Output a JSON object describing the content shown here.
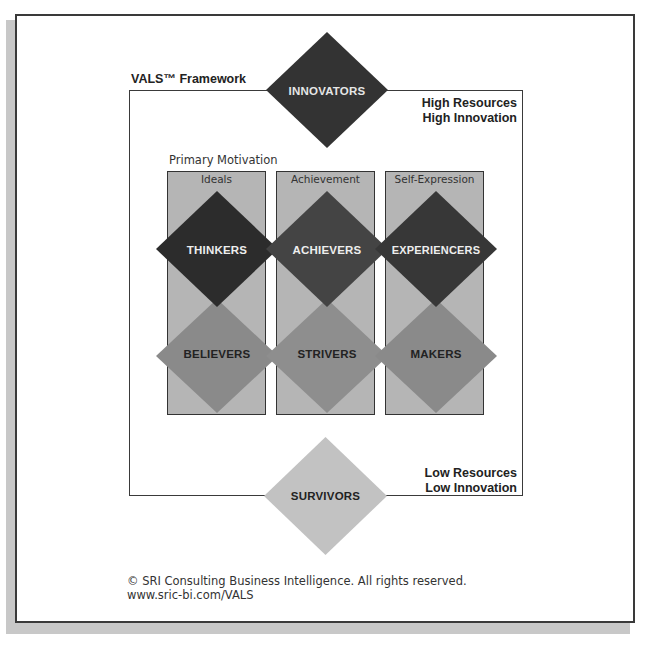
{
  "title": "VALS™ Framework",
  "top_right": [
    "High Resources",
    "High Innovation"
  ],
  "bottom_right": [
    "Low Resources",
    "Low Innovation"
  ],
  "primary_motivation_label": "Primary Motivation",
  "columns": [
    {
      "label": "Ideals"
    },
    {
      "label": "Achievement"
    },
    {
      "label": "Self-Expression"
    }
  ],
  "segments": {
    "innovators": {
      "label": "INNOVATORS",
      "color": "#333333"
    },
    "thinkers": {
      "label": "THINKERS",
      "color": "#2c2c2c"
    },
    "achievers": {
      "label": "ACHIEVERS",
      "color": "#444444"
    },
    "experiencers": {
      "label": "EXPERIENCERS",
      "color": "#373737"
    },
    "believers": {
      "label": "BELIEVERS",
      "color": "#8a8a8a"
    },
    "strivers": {
      "label": "STRIVERS",
      "color": "#8e8e8e"
    },
    "makers": {
      "label": "MAKERS",
      "color": "#8a8a8a"
    },
    "survivors": {
      "label": "SURVIVORS",
      "color": "#c2c2c2"
    }
  },
  "footer": {
    "copyright": "© SRI Consulting Business Intelligence. All rights reserved.",
    "url": "www.sric-bi.com/VALS"
  }
}
